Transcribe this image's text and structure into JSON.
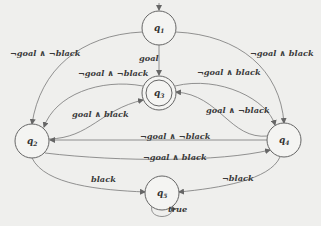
{
  "diagram": {
    "type": "state-automaton",
    "states": [
      {
        "id": "q1",
        "label": "q",
        "sub": "1",
        "accepting": false
      },
      {
        "id": "q2",
        "label": "q",
        "sub": "2",
        "accepting": false
      },
      {
        "id": "q3",
        "label": "q",
        "sub": "3",
        "accepting": true
      },
      {
        "id": "q4",
        "label": "q",
        "sub": "4",
        "accepting": false
      },
      {
        "id": "q5",
        "label": "q",
        "sub": "5",
        "accepting": false
      }
    ],
    "transitions": [
      {
        "from": "q1",
        "to": "q2",
        "label": "¬goal ∧ ¬black"
      },
      {
        "from": "q1",
        "to": "q4",
        "label": "¬goal ∧ black"
      },
      {
        "from": "q1",
        "to": "q3",
        "label": "goal"
      },
      {
        "from": "q3",
        "to": "q2",
        "label": "¬goal ∧ ¬black"
      },
      {
        "from": "q3",
        "to": "q4",
        "label": "¬goal ∧ black"
      },
      {
        "from": "q2",
        "to": "q3",
        "label": "goal ∧ black"
      },
      {
        "from": "q4",
        "to": "q3",
        "label": "goal ∧ ¬black"
      },
      {
        "from": "q4",
        "to": "q2",
        "label": "¬goal ∧ ¬black"
      },
      {
        "from": "q2",
        "to": "q4",
        "label": "¬goal ∧ black"
      },
      {
        "from": "q2",
        "to": "q5",
        "label": "black"
      },
      {
        "from": "q4",
        "to": "q5",
        "label": "¬black"
      },
      {
        "from": "q5",
        "to": "q5",
        "label": "true"
      }
    ]
  }
}
